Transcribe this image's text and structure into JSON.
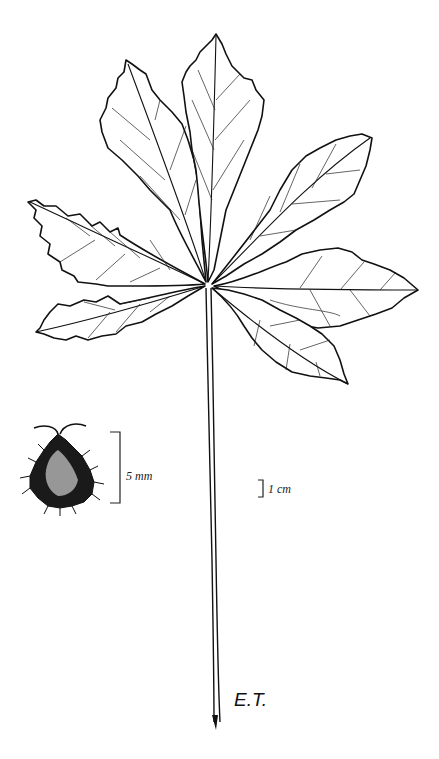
{
  "figure": {
    "leaflet_count": 7,
    "fruit_scale": {
      "label": "5 mm"
    },
    "leaf_scale": {
      "label": "1 cm"
    },
    "artist_initials": "E.T."
  }
}
